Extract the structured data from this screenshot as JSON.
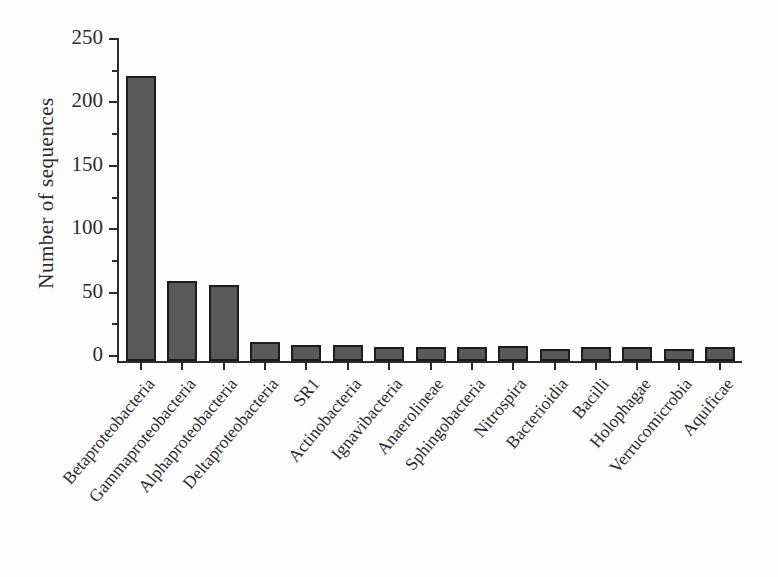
{
  "figure": {
    "background": "#fdfdfd"
  },
  "chart_data": {
    "type": "bar",
    "title": "",
    "xlabel": "",
    "ylabel": "Number of sequences",
    "categories": [
      "Betaproteobacteria",
      "Gammaproteobacteria",
      "Alphaproteobacteria",
      "Deltaproteobacteria",
      "SR1",
      "Actinobacteria",
      "Ignavibacteria",
      "Anaerolineae",
      "Sphingobacteria",
      "Nitrospira",
      "Bacterioidia",
      "Bacilli",
      "Holophagae",
      "Verrucomicrobia",
      "Aquificae"
    ],
    "values": [
      220,
      58,
      55,
      10,
      8,
      8,
      6,
      6,
      6,
      7,
      5,
      6,
      6,
      5,
      6
    ],
    "ylim": [
      0,
      250
    ],
    "yticks_major": [
      0,
      50,
      100,
      150,
      200,
      250
    ],
    "yticks_minor_step": 25,
    "grid": false,
    "legend": false,
    "bar_color": "#595959",
    "bar_border_color": "#1c1c1c",
    "axis_color": "#2b2b2b",
    "text_color": "#2b2b2b"
  }
}
